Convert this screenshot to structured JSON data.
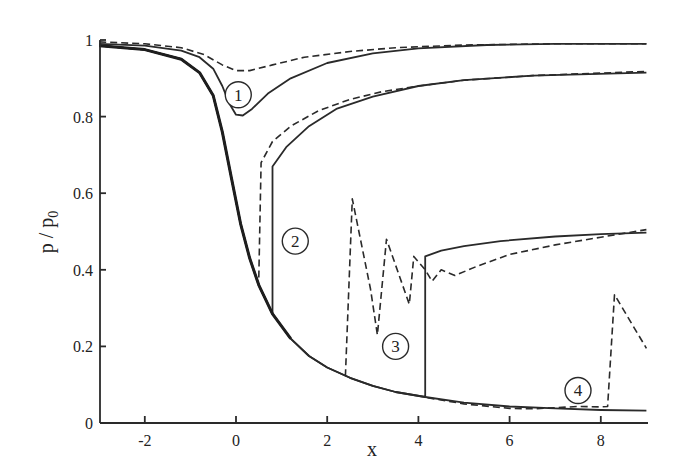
{
  "chart_data": {
    "type": "line",
    "title": "",
    "xlabel": "x",
    "ylabel": "p / p0",
    "xlim": [
      -3,
      9
    ],
    "ylim": [
      0,
      1
    ],
    "grid": false,
    "legend": "none",
    "x_ticks": [
      "-2",
      "0",
      "2",
      "4",
      "6",
      "8"
    ],
    "x_tick_values": [
      -2,
      0,
      2,
      4,
      6,
      8
    ],
    "y_ticks": [
      "0",
      "0.2",
      "0.4",
      "0.6",
      "0.8",
      "1"
    ],
    "y_tick_values": [
      0,
      0.2,
      0.4,
      0.6,
      0.8,
      1
    ],
    "annotations": [
      {
        "label": "1",
        "x": 0.05,
        "y": 0.857
      },
      {
        "label": "2",
        "x": 1.3,
        "y": 0.475
      },
      {
        "label": "3",
        "x": 3.5,
        "y": 0.2
      },
      {
        "label": "4",
        "x": 7.5,
        "y": 0.085
      }
    ],
    "series": [
      {
        "name": "case 1 solid",
        "style": "solid",
        "points": [
          [
            -3,
            0.99
          ],
          [
            -2,
            0.985
          ],
          [
            -1.2,
            0.972
          ],
          [
            -0.8,
            0.955
          ],
          [
            -0.5,
            0.925
          ],
          [
            -0.3,
            0.88
          ],
          [
            -0.15,
            0.835
          ],
          [
            0,
            0.805
          ],
          [
            0.15,
            0.803
          ],
          [
            0.35,
            0.82
          ],
          [
            0.7,
            0.86
          ],
          [
            1.2,
            0.9
          ],
          [
            2,
            0.94
          ],
          [
            3,
            0.965
          ],
          [
            4,
            0.978
          ],
          [
            5.5,
            0.987
          ],
          [
            7,
            0.99
          ],
          [
            9,
            0.99
          ]
        ]
      },
      {
        "name": "case 1 dashed",
        "style": "dashed",
        "points": [
          [
            -3,
            0.995
          ],
          [
            -2,
            0.99
          ],
          [
            -1.2,
            0.98
          ],
          [
            -0.7,
            0.962
          ],
          [
            -0.3,
            0.935
          ],
          [
            0,
            0.92
          ],
          [
            0.3,
            0.92
          ],
          [
            0.8,
            0.935
          ],
          [
            1.5,
            0.955
          ],
          [
            2.5,
            0.97
          ],
          [
            3.5,
            0.98
          ],
          [
            5,
            0.987
          ],
          [
            7,
            0.99
          ],
          [
            9,
            0.99
          ]
        ]
      },
      {
        "name": "case 2 solid",
        "style": "solid",
        "points": [
          [
            -3,
            0.985
          ],
          [
            -2,
            0.975
          ],
          [
            -1.2,
            0.95
          ],
          [
            -0.8,
            0.915
          ],
          [
            -0.5,
            0.855
          ],
          [
            -0.3,
            0.76
          ],
          [
            -0.1,
            0.64
          ],
          [
            0.1,
            0.52
          ],
          [
            0.3,
            0.43
          ],
          [
            0.5,
            0.36
          ],
          [
            0.8,
            0.285
          ],
          [
            0.8,
            0.67
          ],
          [
            1.1,
            0.72
          ],
          [
            1.6,
            0.775
          ],
          [
            2.2,
            0.82
          ],
          [
            3,
            0.852
          ],
          [
            4,
            0.88
          ],
          [
            5,
            0.895
          ],
          [
            6.5,
            0.907
          ],
          [
            9,
            0.915
          ]
        ]
      },
      {
        "name": "case 2 dashed",
        "style": "dashed",
        "points": [
          [
            0.5,
            0.38
          ],
          [
            0.55,
            0.68
          ],
          [
            0.8,
            0.735
          ],
          [
            1.2,
            0.775
          ],
          [
            1.8,
            0.815
          ],
          [
            2.5,
            0.845
          ],
          [
            3.2,
            0.865
          ],
          [
            4,
            0.88
          ],
          [
            5,
            0.895
          ],
          [
            6.5,
            0.907
          ],
          [
            9,
            0.918
          ]
        ]
      },
      {
        "name": "case 3 solid",
        "style": "solid",
        "points": [
          [
            -3,
            0.985
          ],
          [
            -2,
            0.975
          ],
          [
            -1.2,
            0.95
          ],
          [
            -0.8,
            0.915
          ],
          [
            -0.5,
            0.855
          ],
          [
            -0.3,
            0.76
          ],
          [
            -0.1,
            0.64
          ],
          [
            0.1,
            0.52
          ],
          [
            0.3,
            0.43
          ],
          [
            0.5,
            0.36
          ],
          [
            0.8,
            0.285
          ],
          [
            1.2,
            0.22
          ],
          [
            1.6,
            0.175
          ],
          [
            2,
            0.145
          ],
          [
            2.5,
            0.118
          ],
          [
            3,
            0.097
          ],
          [
            3.5,
            0.081
          ],
          [
            4.15,
            0.068
          ],
          [
            4.15,
            0.435
          ],
          [
            4.5,
            0.45
          ],
          [
            5,
            0.462
          ],
          [
            5.8,
            0.475
          ],
          [
            7,
            0.487
          ],
          [
            8,
            0.493
          ],
          [
            9,
            0.497
          ]
        ]
      },
      {
        "name": "case 3 dashed",
        "style": "dashed",
        "points": [
          [
            2.4,
            0.122
          ],
          [
            2.55,
            0.585
          ],
          [
            2.95,
            0.35
          ],
          [
            3.1,
            0.23
          ],
          [
            3.3,
            0.48
          ],
          [
            3.8,
            0.31
          ],
          [
            3.9,
            0.435
          ],
          [
            4.15,
            0.4
          ],
          [
            4.3,
            0.37
          ],
          [
            4.5,
            0.4
          ],
          [
            4.8,
            0.385
          ],
          [
            5.3,
            0.41
          ],
          [
            6,
            0.44
          ],
          [
            7,
            0.465
          ],
          [
            8,
            0.485
          ],
          [
            9,
            0.505
          ]
        ]
      },
      {
        "name": "case 4 solid",
        "style": "solid",
        "points": [
          [
            -3,
            0.985
          ],
          [
            -2,
            0.975
          ],
          [
            -1.2,
            0.95
          ],
          [
            -0.8,
            0.915
          ],
          [
            -0.5,
            0.855
          ],
          [
            -0.3,
            0.76
          ],
          [
            -0.1,
            0.64
          ],
          [
            0.1,
            0.52
          ],
          [
            0.3,
            0.43
          ],
          [
            0.5,
            0.36
          ],
          [
            0.8,
            0.285
          ],
          [
            1.2,
            0.22
          ],
          [
            1.6,
            0.175
          ],
          [
            2,
            0.145
          ],
          [
            2.5,
            0.118
          ],
          [
            3,
            0.097
          ],
          [
            3.5,
            0.081
          ],
          [
            4.15,
            0.068
          ],
          [
            5,
            0.053
          ],
          [
            6,
            0.043
          ],
          [
            7,
            0.038
          ],
          [
            8,
            0.034
          ],
          [
            9,
            0.032
          ]
        ]
      },
      {
        "name": "case 4 dashed",
        "style": "dashed",
        "points": [
          [
            4.2,
            0.066
          ],
          [
            5,
            0.05
          ],
          [
            6,
            0.038
          ],
          [
            6.5,
            0.037
          ],
          [
            7,
            0.04
          ],
          [
            7.5,
            0.043
          ],
          [
            8,
            0.042
          ],
          [
            8.15,
            0.043
          ],
          [
            8.3,
            0.335
          ],
          [
            9,
            0.195
          ]
        ]
      }
    ]
  }
}
